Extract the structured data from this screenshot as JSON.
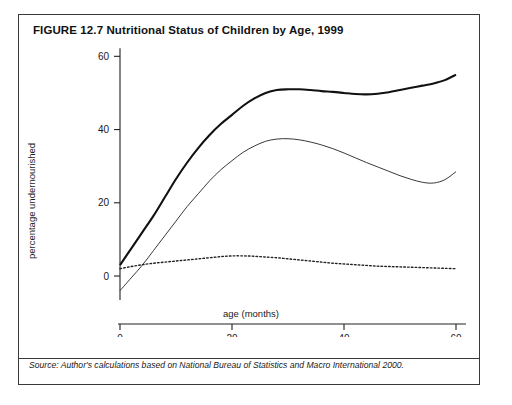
{
  "figure": {
    "title": "FIGURE 12.7  Nutritional Status of Children by Age, 1999",
    "source": "Source: Author's calculations based on National Bureau of Statistics and Macro International 2000."
  },
  "chart_data": {
    "type": "line",
    "title": "Nutritional Status of Children by Age, 1999",
    "xlabel": "age (months)",
    "ylabel": "percentage undernourished",
    "xlim": [
      0,
      60
    ],
    "ylim": [
      -6,
      62
    ],
    "xticks": [
      0,
      20,
      40,
      60
    ],
    "yticks": [
      0,
      20,
      40,
      60
    ],
    "grid": false,
    "legend_position": "bottom-center",
    "x": [
      0,
      2,
      4,
      6,
      8,
      10,
      12,
      14,
      16,
      18,
      20,
      22,
      24,
      26,
      28,
      30,
      32,
      34,
      36,
      38,
      40,
      42,
      44,
      46,
      48,
      50,
      52,
      54,
      56,
      58,
      60
    ],
    "series": [
      {
        "name": "stunted",
        "style": "thick-solid",
        "values": [
          3.0,
          7.5,
          12.0,
          16.5,
          21.5,
          26.5,
          31.0,
          35.0,
          38.5,
          41.5,
          44.0,
          46.5,
          48.5,
          50.0,
          50.8,
          51.0,
          51.0,
          50.8,
          50.5,
          50.3,
          50.0,
          49.7,
          49.6,
          49.8,
          50.2,
          50.8,
          51.4,
          52.0,
          52.6,
          53.5,
          55.0
        ]
      },
      {
        "name": "underweight",
        "style": "thin-solid",
        "values": [
          -4.0,
          -0.5,
          3.0,
          7.0,
          11.0,
          15.0,
          19.0,
          22.5,
          26.0,
          29.0,
          31.5,
          33.8,
          35.5,
          36.8,
          37.4,
          37.5,
          37.2,
          36.6,
          35.8,
          34.8,
          33.6,
          32.3,
          31.0,
          29.8,
          28.6,
          27.4,
          26.4,
          25.6,
          25.4,
          26.3,
          28.5
        ]
      },
      {
        "name": "wasted",
        "style": "dotted",
        "values": [
          2.0,
          2.6,
          3.1,
          3.5,
          3.8,
          4.1,
          4.4,
          4.7,
          5.0,
          5.3,
          5.5,
          5.5,
          5.4,
          5.2,
          5.0,
          4.7,
          4.4,
          4.1,
          3.8,
          3.5,
          3.3,
          3.1,
          2.9,
          2.7,
          2.6,
          2.5,
          2.4,
          2.3,
          2.2,
          2.1,
          2.0
        ]
      }
    ],
    "legend": [
      {
        "label": "underweight",
        "style": "thin-solid"
      },
      {
        "label": "stunted",
        "style": "thick-solid"
      },
      {
        "label": "wasted",
        "style": "dotted"
      }
    ]
  }
}
